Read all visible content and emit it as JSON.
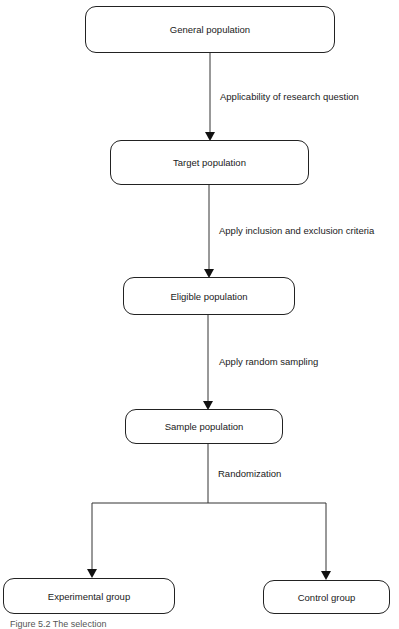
{
  "nodes": {
    "general": "General population",
    "target": "Target population",
    "eligible": "Eligible population",
    "sample": "Sample population",
    "experimental": "Experimental group",
    "control": "Control group"
  },
  "edges": {
    "general_to_target": "Applicability of research question",
    "target_to_eligible": "Apply inclusion and exclusion criteria",
    "eligible_to_sample": "Apply random sampling",
    "sample_to_groups": "Randomization"
  },
  "caption": "Figure 5.2 The selection"
}
